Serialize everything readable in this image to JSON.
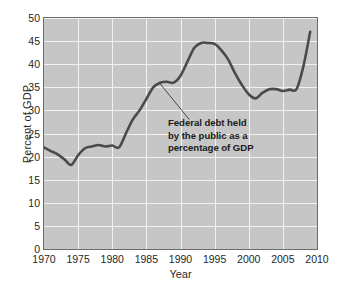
{
  "chart_data": {
    "type": "line",
    "title": "",
    "xlabel": "Year",
    "ylabel": "Percent of GDP",
    "xlim": [
      1970,
      2010
    ],
    "ylim": [
      0,
      50
    ],
    "xticks": [
      1970,
      1975,
      1980,
      1985,
      1990,
      1995,
      2000,
      2005,
      2010
    ],
    "yticks": [
      0,
      5,
      10,
      15,
      20,
      25,
      30,
      35,
      40,
      45,
      50
    ],
    "grid": true,
    "legend": "none",
    "series": [
      {
        "name": "Federal debt held by the public as a percentage of GDP",
        "x": [
          1970,
          1971,
          1972,
          1973,
          1974,
          1975,
          1976,
          1977,
          1978,
          1979,
          1980,
          1981,
          1982,
          1983,
          1984,
          1985,
          1986,
          1987,
          1988,
          1989,
          1990,
          1991,
          1992,
          1993,
          1994,
          1995,
          1996,
          1997,
          1998,
          1999,
          2000,
          2001,
          2002,
          2003,
          2004,
          2005,
          2006,
          2007,
          2008,
          2009
        ],
        "values": [
          22.0,
          21.2,
          20.5,
          19.4,
          18.2,
          20.3,
          21.8,
          22.2,
          22.5,
          22.2,
          22.4,
          22.0,
          25.0,
          28.0,
          30.0,
          32.5,
          35.0,
          36.0,
          36.2,
          36.0,
          37.5,
          40.5,
          43.5,
          44.6,
          44.6,
          44.4,
          43.0,
          41.0,
          38.0,
          35.5,
          33.5,
          32.6,
          33.8,
          34.6,
          34.6,
          34.2,
          34.5,
          34.6,
          39.5,
          47.0
        ]
      }
    ],
    "annotations": [
      {
        "text_lines": [
          "Federal debt held",
          "by the public as a",
          "percentage of GDP"
        ],
        "points_to_x": 1987,
        "points_to_y": 36.0
      }
    ],
    "colors": {
      "plot_background": "#c6c6c6",
      "gridline": "#f2f2f2",
      "line": "#4a4a4a",
      "frame": "#6b6b6b",
      "text": "#1f1f1f"
    }
  }
}
